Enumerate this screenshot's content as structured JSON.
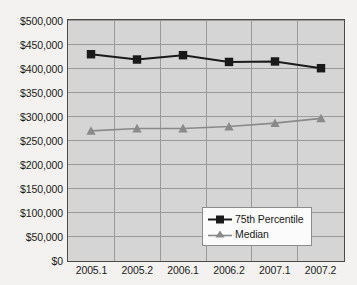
{
  "chart_data": {
    "type": "line",
    "title": "",
    "subtitle": "",
    "xlabel": "",
    "ylabel": "",
    "categories": [
      "2005.1",
      "2005.2",
      "2006.1",
      "2006.2",
      "2007.1",
      "2007.2"
    ],
    "series": [
      {
        "name": "75th Percentile",
        "values": [
          429000,
          418000,
          427000,
          413000,
          414000,
          400000
        ],
        "color": "#1a1a1a",
        "marker": "square"
      },
      {
        "name": "Median",
        "values": [
          270000,
          275000,
          275000,
          279000,
          286000,
          296000
        ],
        "color": "#8a8a8a",
        "marker": "triangle"
      }
    ],
    "ylim": [
      0,
      500000
    ],
    "ytick_values": [
      0,
      50000,
      100000,
      150000,
      200000,
      250000,
      300000,
      350000,
      400000,
      450000,
      500000
    ],
    "ytick_labels": [
      "$0",
      "$50,000",
      "$100,000",
      "$150,000",
      "$200,000",
      "$250,000",
      "$300,000",
      "$350,000",
      "$400,000",
      "$450,000",
      "$500,000"
    ],
    "grid": true,
    "grid_axis": "both",
    "legend_position": "bottom-right",
    "legend_entries": [
      "75th Percentile",
      "Median"
    ],
    "plot_background": "#d5d5d5",
    "page_background": "#f4f2f0",
    "axis_color": "#4a4a4a",
    "grid_color": "#9a9a9a"
  }
}
